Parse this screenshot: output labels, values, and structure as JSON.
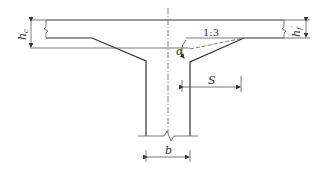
{
  "diagram": {
    "labels": {
      "hc": "h",
      "hc_sub": "c",
      "hf": "h",
      "hf_sub": "f",
      "hf_sup": "′",
      "slope": "1:3",
      "alpha": "α",
      "s": "S",
      "b": "b"
    },
    "colors": {
      "line": "#333333",
      "background": "#ffffff"
    }
  }
}
